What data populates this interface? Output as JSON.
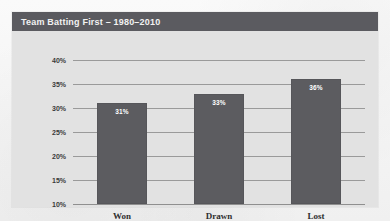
{
  "chart_data": {
    "type": "bar",
    "title": "Team Batting First – 1980–2010",
    "xlabel": "",
    "ylabel": "",
    "categories": [
      "Won",
      "Drawn",
      "Lost"
    ],
    "values": [
      31,
      33,
      36
    ],
    "data_labels": [
      "31%",
      "33%",
      "36%"
    ],
    "ylim": [
      10,
      40
    ],
    "yticks": [
      40,
      35,
      30,
      25,
      20,
      15,
      10
    ],
    "ytick_labels": [
      "40%",
      "35%",
      "30%",
      "25%",
      "20%",
      "15%",
      "10%"
    ],
    "grid": true,
    "legend": false,
    "series": [
      {
        "name": "Team Batting First",
        "values": [
          31,
          33,
          36
        ]
      }
    ]
  },
  "panel": {
    "title": "Team Batting First – 1980–2010"
  },
  "colors": {
    "title_bar": "#5b5b60",
    "panel_background": "#e2e2e2",
    "bar_fill": "#5c5c60",
    "gridline": "#9a9a9a",
    "page_background": "#f7f7f7",
    "title_text": "#f2f2f2",
    "value_label_text": "#ffffff"
  }
}
